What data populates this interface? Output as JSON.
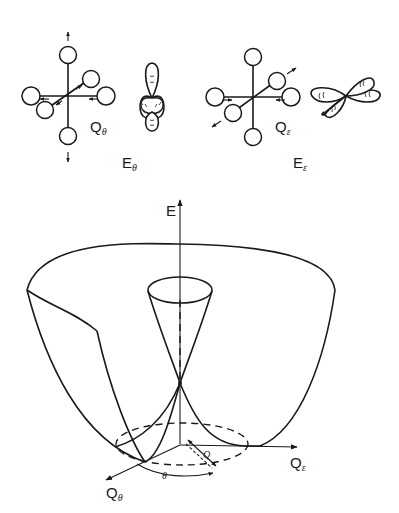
{
  "figure": {
    "panels": {
      "q_theta_mode": {
        "mode_label": "Q",
        "mode_subscript": "θ",
        "orbital_label": "E",
        "orbital_subscript": "θ"
      },
      "q_epsilon_mode": {
        "mode_label": "Q",
        "mode_subscript": "ε",
        "orbital_label": "E",
        "orbital_subscript": "ε"
      }
    },
    "potential_surface": {
      "energy_axis_label": "E",
      "axis_x_label": "Q",
      "axis_x_subscript": "ε",
      "axis_y_label": "Q",
      "axis_y_subscript": "θ",
      "radius_label": "Q",
      "angle_label": "θ"
    }
  },
  "colors": {
    "ink": "#1a1a1a",
    "background": "#ffffff"
  }
}
